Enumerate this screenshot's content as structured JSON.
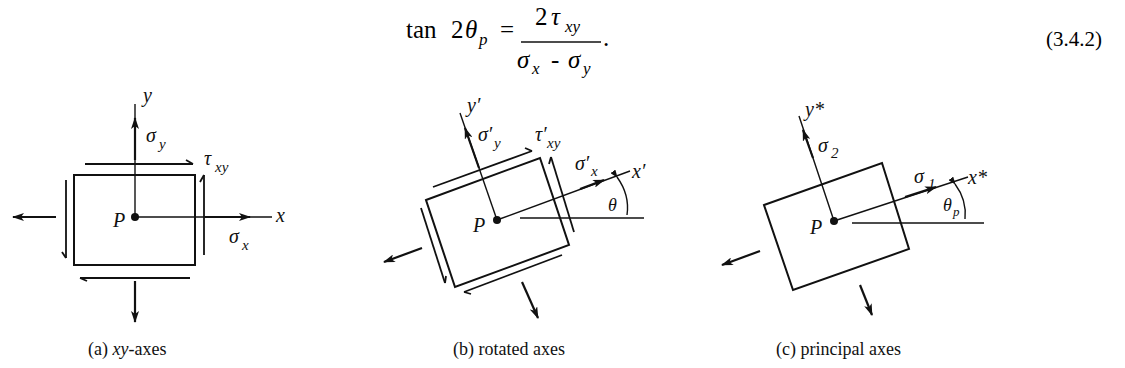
{
  "equation": {
    "lhs_func": "tan",
    "lhs_coef": "2",
    "lhs_var": "θ",
    "lhs_sub": "p",
    "equals": "=",
    "num_coef": "2",
    "num_var": "τ",
    "num_sub": "xy",
    "den_var1": "σ",
    "den_sub1": "x",
    "den_minus": "-",
    "den_var2": "σ",
    "den_sub2": "y",
    "period": ".",
    "number": "(3.4.2)"
  },
  "panels": [
    {
      "id": "a",
      "caption_prefix": "(a) ",
      "caption_italic": "xy",
      "caption_suffix": "-axes",
      "axis_x": "x",
      "axis_y": "y",
      "point": "P",
      "sigma_x": "σ",
      "sigma_x_sub": "x",
      "sigma_y": "σ",
      "sigma_y_sub": "y",
      "tau": "τ",
      "tau_sub": "xy"
    },
    {
      "id": "b",
      "caption": "(b) rotated axes",
      "axis_x": "x′",
      "axis_y": "y′",
      "point": "P",
      "sigma_x": "σ′",
      "sigma_x_sub": "x",
      "sigma_y": "σ′",
      "sigma_y_sub": "y",
      "tau": "τ′",
      "tau_sub": "xy",
      "angle": "θ"
    },
    {
      "id": "c",
      "caption": "(c) principal axes",
      "axis_x": "x*",
      "axis_y": "y*",
      "point": "P",
      "sigma_1": "σ",
      "sigma_1_sub": "1",
      "sigma_2": "σ",
      "sigma_2_sub": "2",
      "angle": "θ",
      "angle_sub": "p"
    }
  ]
}
